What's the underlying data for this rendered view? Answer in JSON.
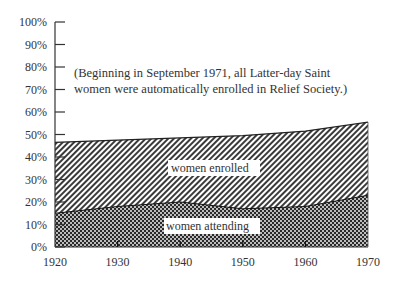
{
  "chart_data": {
    "type": "area",
    "title": "",
    "xlabel": "",
    "ylabel": "",
    "x": [
      1920,
      1930,
      1940,
      1950,
      1960,
      1970
    ],
    "series": [
      {
        "name": "women attending",
        "values": [
          15,
          18,
          20,
          17,
          18,
          23
        ],
        "pattern": "checker"
      },
      {
        "name": "women enrolled",
        "values": [
          46.5,
          47.5,
          48.5,
          49.5,
          51.5,
          55.5
        ],
        "pattern": "diagonal-hatch"
      }
    ],
    "stacked": false,
    "ylim": [
      0,
      100
    ],
    "xlim": [
      1920,
      1970
    ],
    "y_ticks": [
      "0%",
      "10%",
      "20%",
      "30%",
      "40%",
      "50%",
      "60%",
      "70%",
      "80%",
      "90%",
      "100%"
    ],
    "x_ticks": [
      "1920",
      "1930",
      "1940",
      "1950",
      "1960",
      "1970"
    ],
    "grid": false,
    "legend": "none (inline area labels)",
    "annotations": [
      "(Beginning in September 1971, all Latter-day Saint",
      "women were automatically enrolled in Relief Society.)"
    ],
    "area_labels": {
      "enrolled": "women enrolled",
      "attending": "women attending"
    }
  }
}
